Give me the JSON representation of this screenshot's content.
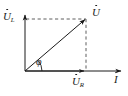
{
  "diagram": {
    "type": "phasor-diagram",
    "background_color": "#ffffff",
    "line_color": "#1a1a1a",
    "dash_color": "#555555",
    "labels": {
      "inductor_voltage": {
        "symbol": "U",
        "subscript": "L",
        "overdot": true
      },
      "total_voltage": {
        "symbol": "U",
        "subscript": "",
        "overdot": true
      },
      "resistor_voltage": {
        "symbol": "U",
        "subscript": "R",
        "overdot": true
      },
      "current": {
        "symbol": "I",
        "subscript": "",
        "overdot": true
      },
      "phase_angle": {
        "symbol": "φ"
      }
    },
    "geometry": {
      "origin": {
        "x": 25,
        "y": 71
      },
      "current_axis_tip": {
        "x": 121,
        "y": 71
      },
      "inductor_axis_tip": {
        "x": 25,
        "y": 16
      },
      "resultant_tip": {
        "x": 86,
        "y": 19
      },
      "resistor_tip": {
        "x": 86,
        "y": 71
      },
      "inductor_tip": {
        "x": 25,
        "y": 19
      },
      "phase_angle_degrees": 40,
      "arc_radius": 16
    },
    "vectors": [
      {
        "name": "resultant-voltage",
        "from": "origin",
        "to": "resultant_tip",
        "style": "solid",
        "arrow": true
      },
      {
        "name": "resistor-voltage",
        "from": "origin",
        "to": "resistor_tip",
        "style": "solid",
        "arrow": true
      },
      {
        "name": "inductor-voltage",
        "from": "origin",
        "to": "inductor_tip",
        "style": "solid",
        "arrow": true
      }
    ],
    "construction_lines": [
      {
        "name": "top-projection",
        "from": "inductor_tip",
        "to": "resultant_tip",
        "style": "dashed"
      },
      {
        "name": "right-projection",
        "from": "resultant_tip",
        "to": "resistor_tip",
        "style": "dashed"
      }
    ],
    "axes": [
      {
        "name": "current-axis",
        "orientation": "horizontal",
        "arrow": true
      },
      {
        "name": "inductor-axis",
        "orientation": "vertical",
        "arrow": true
      }
    ]
  }
}
